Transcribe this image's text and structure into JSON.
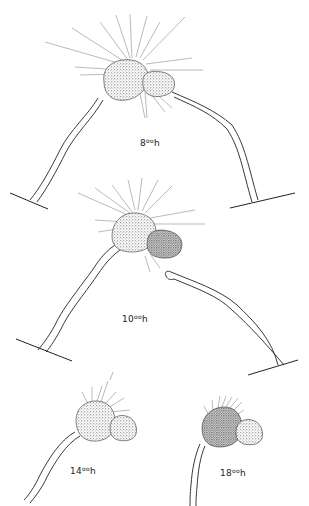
{
  "figure": {
    "panels": [
      {
        "id": "panel-8h",
        "hour": "8",
        "sup": "oo",
        "suffix": "h",
        "label_pos": [
          140,
          137
        ]
      },
      {
        "id": "panel-10h",
        "hour": "10",
        "sup": "oo",
        "suffix": "h",
        "label_pos": [
          122,
          313
        ]
      },
      {
        "id": "panel-14h",
        "hour": "14",
        "sup": "oo",
        "suffix": "h",
        "label_pos": [
          70,
          465
        ]
      },
      {
        "id": "panel-18h",
        "hour": "18",
        "sup": "oo",
        "suffix": "h",
        "label_pos": [
          220,
          467
        ]
      }
    ],
    "ink_color": "#1a1a1a",
    "stipple_color": "#555555"
  }
}
